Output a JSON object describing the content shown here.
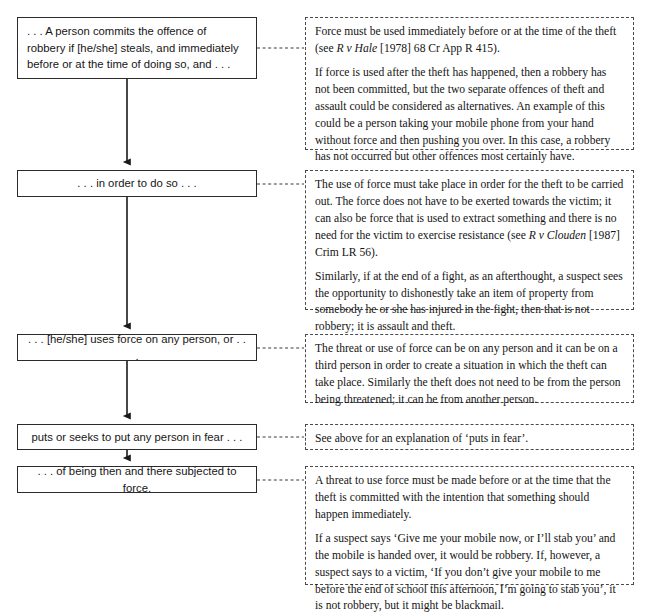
{
  "diagram": {
    "type": "flowchart-with-annotations",
    "colors": {
      "background": "#ffffff",
      "box_border": "#2b2b2b",
      "note_border": "#4a4a4a",
      "connector": "#1a1a1a",
      "text": "#141414"
    }
  },
  "flow": {
    "steps": [
      {
        "id": "step-1",
        "text": ". . . A person commits the offence of robbery if [he/she] steals, and immediately before or at the time of doing so, and . . .",
        "align": "left"
      },
      {
        "id": "step-2",
        "text": ". . . in order to do so . . .",
        "align": "center"
      },
      {
        "id": "step-3",
        "text": ". . . [he/she] uses force on any person, or . . .",
        "align": "center"
      },
      {
        "id": "step-4",
        "text": "puts or seeks to put any person in fear . . .",
        "align": "center"
      },
      {
        "id": "step-5",
        "text": ". . . of being then and there subjected to force.",
        "align": "center"
      }
    ]
  },
  "notes": [
    {
      "id": "note-1",
      "paragraphs": [
        "Force must be used immediately before or at the time of the theft (see <i>R v Hale</i> [1978] 68 Cr App R 415).",
        "If force is used after the theft has happened, then a robbery has not been committed, but the two separate offences of theft and assault could be considered as alternatives. An example of this could be a person taking your mobile phone from your hand without force and then pushing you over. In this case, a robbery has not occurred but other offences most certainly have."
      ]
    },
    {
      "id": "note-2",
      "paragraphs": [
        "The use of force must take place in order for the theft to be carried out. The force does not have to be exerted towards the victim; it can also be force that is used to extract something and there is no need for the victim to exercise resistance (see <i>R v Clouden</i> [1987] Crim LR 56).",
        "Similarly, if at the end of a fight, as an afterthought, a suspect sees the opportunity to dishonestly take an item of property from somebody he or she has injured in the fight, then that is not robbery; it is assault and theft."
      ]
    },
    {
      "id": "note-3",
      "paragraphs": [
        "The threat or use of force can be on any person and it can be on a third person in order to create a situation in which the theft can take place. Similarly the theft does not need to be from the person being threatened; it can be from another person."
      ]
    },
    {
      "id": "note-4",
      "paragraphs": [
        "See above for an explanation of &lsquo;puts in fear&rsquo;."
      ]
    },
    {
      "id": "note-5",
      "paragraphs": [
        "A threat to use force must be made before or at the time that the theft is committed with the intention that something should happen immediately.",
        "If a suspect says &lsquo;Give me your mobile now, or I&rsquo;ll stab you&rsquo; and the mobile is handed over, it would be robbery. If, however, a suspect says to a victim, &lsquo;If you don&rsquo;t give your mobile to me before the end of school this afternoon, I&rsquo;m going to stab you&rsquo;, it is not robbery, but it might be blackmail."
      ]
    }
  ],
  "connectors": {
    "vertical_arrows": [
      {
        "from": "step-1",
        "to": "step-2",
        "x": 127,
        "y1": 79,
        "y2": 170
      },
      {
        "from": "step-2",
        "to": "step-3",
        "x": 127,
        "y1": 197,
        "y2": 334
      },
      {
        "from": "step-3",
        "to": "step-4",
        "x": 127,
        "y1": 361,
        "y2": 424
      },
      {
        "from": "step-4",
        "to": "step-5",
        "x": 127,
        "y1": 450,
        "y2": 466
      }
    ],
    "dashed_links": [
      {
        "from": "step-1",
        "to": "note-1",
        "y": 48
      },
      {
        "from": "step-2",
        "to": "note-2",
        "y": 184
      },
      {
        "from": "step-3",
        "to": "note-3",
        "y": 348
      },
      {
        "from": "step-4",
        "to": "note-4",
        "y": 437
      },
      {
        "from": "step-5",
        "to": "note-5",
        "y": 480
      }
    ]
  }
}
